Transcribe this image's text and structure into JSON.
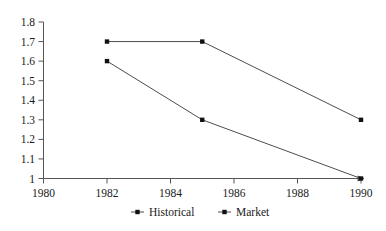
{
  "chart_data": {
    "type": "line",
    "title": "",
    "subtitle": "",
    "xlabel": "",
    "ylabel": "",
    "x": [
      1982,
      1985,
      1990
    ],
    "xlim": [
      1980,
      1990
    ],
    "ylim": [
      1,
      1.8
    ],
    "grid": false,
    "legend_position": "bottom",
    "xticks": [
      "1980",
      "1982",
      "1984",
      "1986",
      "1988",
      "1990"
    ],
    "xtick_values": [
      1980,
      1982,
      1984,
      1986,
      1988,
      1990
    ],
    "yticks": [
      "1",
      "1.1",
      "1.2",
      "1.3",
      "1.4",
      "1.5",
      "1.6",
      "1.7",
      "1.8"
    ],
    "ytick_values": [
      1,
      1.1,
      1.2,
      1.3,
      1.4,
      1.5,
      1.6,
      1.7,
      1.8
    ],
    "series": [
      {
        "name": "Historical",
        "marker": "square",
        "x": [
          1982,
          1985,
          1990
        ],
        "values": [
          1.7,
          1.7,
          1.3
        ]
      },
      {
        "name": "Market",
        "marker": "square",
        "x": [
          1982,
          1985,
          1990
        ],
        "values": [
          1.6,
          1.3,
          1.0
        ]
      }
    ],
    "colors": {
      "line": "#4d4d4d",
      "marker": "#111111",
      "axis": "#555555",
      "text": "#1a1a1a",
      "background": "#ffffff"
    }
  },
  "legend": {
    "entries": [
      {
        "label": "Historical",
        "marker_icon": "square-marker-icon"
      },
      {
        "label": "Market",
        "marker_icon": "square-marker-icon"
      }
    ]
  },
  "axes": {
    "y_axis_name": "value-axis",
    "x_axis_name": "year-axis",
    "x_axis_has_arrowhead": true
  }
}
